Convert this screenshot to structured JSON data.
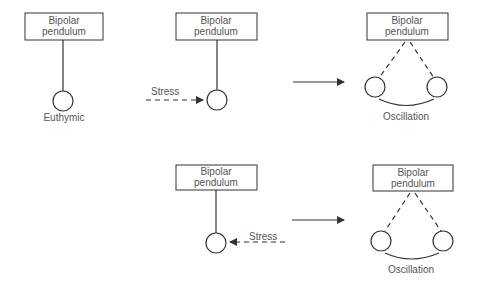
{
  "diagram": {
    "colors": {
      "stroke": "#333333",
      "text": "#555555",
      "background": "#ffffff"
    },
    "panels": [
      {
        "id": "euthymic",
        "box_label": [
          "Bipolar",
          "pendulum"
        ],
        "caption": "Euthymic"
      },
      {
        "id": "stress-right",
        "box_label": [
          "Bipolar",
          "pendulum"
        ],
        "stress_label": "Stress"
      },
      {
        "id": "oscillation-top",
        "box_label": [
          "Bipolar",
          "pendulum"
        ],
        "caption": "Oscillation"
      },
      {
        "id": "stress-left",
        "box_label": [
          "Bipolar",
          "pendulum"
        ],
        "stress_label": "Stress"
      },
      {
        "id": "oscillation-bottom",
        "box_label": [
          "Bipolar",
          "pendulum"
        ],
        "caption": "Oscillation"
      }
    ]
  }
}
